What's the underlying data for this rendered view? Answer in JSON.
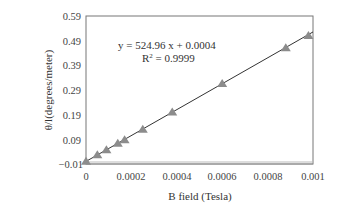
{
  "chart_data": {
    "type": "scatter",
    "title": "",
    "xlabel": "B field (Tesla)",
    "ylabel": "θ/l(degrees/meter)",
    "xlim": [
      0,
      0.001
    ],
    "ylim": [
      -0.01,
      0.59
    ],
    "x_ticks": [
      "0",
      "0.0002",
      "0.0004",
      "0.0006",
      "0.0008",
      "0.001"
    ],
    "y_ticks": [
      "0.59",
      "0.49",
      "0.39",
      "0.29",
      "0.19",
      "0.09",
      "−0.01"
    ],
    "grid": false,
    "legend": null,
    "series": [
      {
        "name": "measured",
        "marker": "triangle",
        "color": "#8c8c8c",
        "x": [
          0,
          5e-05,
          9e-05,
          0.00014,
          0.00017,
          0.00025,
          0.00038,
          0.0006,
          0.00088,
          0.00098
        ],
        "y": [
          0,
          0.026,
          0.047,
          0.073,
          0.087,
          0.13,
          0.2,
          0.315,
          0.46,
          0.51
        ]
      }
    ],
    "fit": {
      "type": "linear",
      "slope": 524.96,
      "intercept": 0.0004,
      "r2": 0.9999,
      "color": "#333333"
    },
    "annotations": {
      "equation": "y = 524.96 x + 0.0004",
      "r_squared_prefix": "R",
      "r_squared_sup": "2",
      "r_squared_value": " = 0.9999"
    }
  }
}
